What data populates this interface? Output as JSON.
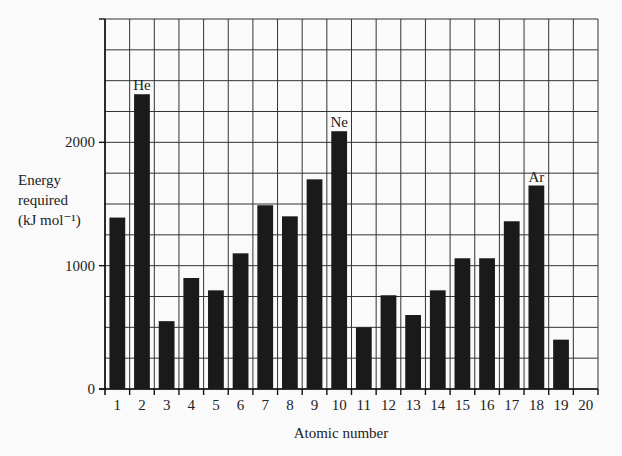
{
  "chart_data": {
    "type": "bar",
    "title": "",
    "xlabel": "Atomic number",
    "ylabel_lines": [
      "Energy",
      "required",
      "(kJ mol⁻¹)"
    ],
    "ylabel": "Energy required (kJ mol⁻¹)",
    "categories": [
      "1",
      "2",
      "3",
      "4",
      "5",
      "6",
      "7",
      "8",
      "9",
      "10",
      "11",
      "12",
      "13",
      "14",
      "15",
      "16",
      "17",
      "18",
      "19",
      "20"
    ],
    "values": [
      1390,
      2390,
      550,
      900,
      800,
      1100,
      1490,
      1400,
      1700,
      2090,
      500,
      760,
      600,
      800,
      1060,
      1060,
      1360,
      1650,
      400,
      null
    ],
    "annotations": [
      {
        "category": "2",
        "label": "He"
      },
      {
        "category": "10",
        "label": "Ne"
      },
      {
        "category": "18",
        "label": "Ar"
      }
    ],
    "yticks": [
      0,
      1000,
      2000
    ],
    "ylim": [
      0,
      3000
    ],
    "grid_step_y": 250,
    "grid": true,
    "legend": null,
    "bar_color": "#1a1a1a"
  }
}
